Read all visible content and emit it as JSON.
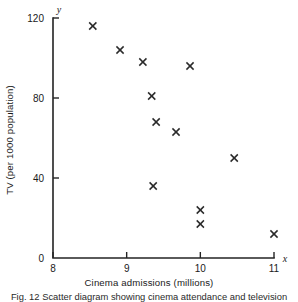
{
  "chart_data": {
    "type": "scatter",
    "title": "",
    "xlabel": "Cinema admissions (millions)",
    "ylabel": "TV (per 1000 population)",
    "x_axis_symbol": "x",
    "y_axis_symbol": "y",
    "xlim": [
      8,
      11
    ],
    "ylim": [
      0,
      120
    ],
    "xticks": [
      8,
      9,
      10,
      11
    ],
    "xtick_labels": [
      "8",
      "9",
      "10",
      "11"
    ],
    "yticks": [
      0,
      40,
      80,
      120
    ],
    "ytick_labels": [
      "0",
      "40",
      "80",
      "120"
    ],
    "grid": false,
    "legend": null,
    "marker": "x",
    "marker_color": "#2a2a2a",
    "points": [
      {
        "x": 8.54,
        "y": 116
      },
      {
        "x": 8.91,
        "y": 104
      },
      {
        "x": 9.22,
        "y": 98
      },
      {
        "x": 9.86,
        "y": 96
      },
      {
        "x": 9.34,
        "y": 81
      },
      {
        "x": 9.4,
        "y": 68
      },
      {
        "x": 9.67,
        "y": 63
      },
      {
        "x": 10.46,
        "y": 50
      },
      {
        "x": 9.36,
        "y": 36
      },
      {
        "x": 10.0,
        "y": 24
      },
      {
        "x": 10.0,
        "y": 17
      },
      {
        "x": 11.0,
        "y": 12
      }
    ]
  },
  "caption": {
    "text": "Fig. 12  Scatter diagram showing cinema attendance and television"
  }
}
